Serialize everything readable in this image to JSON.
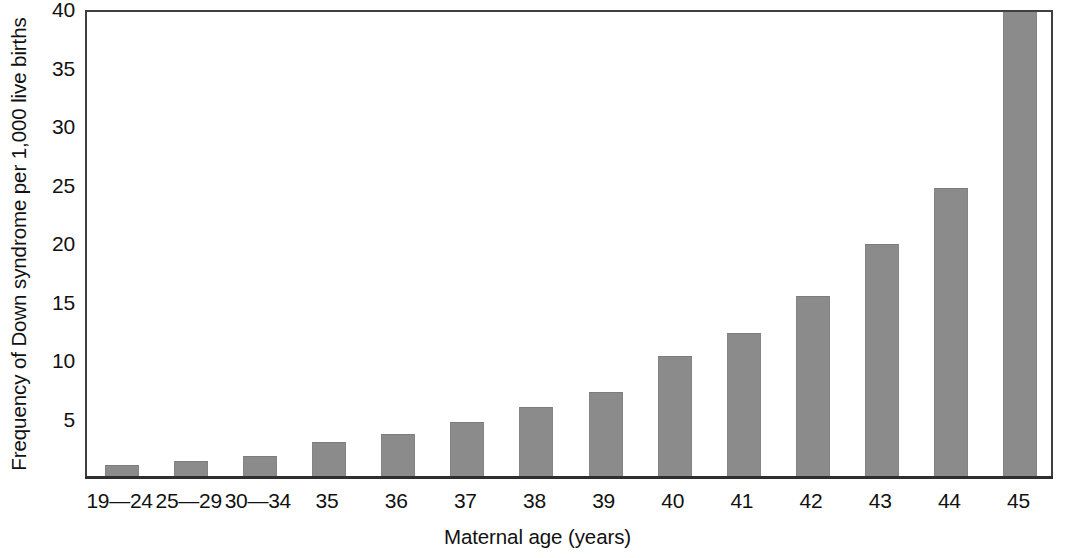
{
  "chart_data": {
    "type": "bar",
    "title": "",
    "xlabel": "Maternal age (years)",
    "ylabel": "Frequency of Down syndrome per 1,000 live births",
    "categories": [
      "19—24",
      "25—29",
      "30—34",
      "35",
      "36",
      "37",
      "38",
      "39",
      "40",
      "41",
      "42",
      "43",
      "44",
      "45"
    ],
    "values": [
      0.9,
      1.3,
      1.7,
      2.9,
      3.6,
      4.6,
      5.9,
      7.2,
      10.3,
      12.2,
      15.4,
      19.8,
      24.6,
      41.0
    ],
    "ylim": [
      0,
      40
    ],
    "yticks": [
      5,
      10,
      15,
      20,
      25,
      30,
      35,
      40
    ],
    "ytick_labels": [
      "5",
      "10",
      "15",
      "20",
      "25",
      "30",
      "35",
      "40"
    ],
    "grid": false,
    "legend": "none",
    "bar_color": "#8b8b8b",
    "axis_color": "#3f3f3f",
    "clipped_bars": [
      "45"
    ]
  },
  "figure": {
    "background": "#ffffff"
  }
}
